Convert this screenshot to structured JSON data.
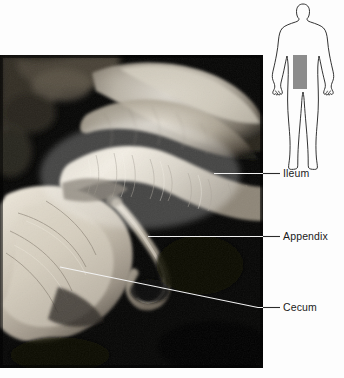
{
  "figure": {
    "kind": "anatomical-dissection-photograph",
    "region": "ileocecal junction",
    "background_color": "#fdfdfd"
  },
  "photo": {
    "name": "cadaver dissection of the ileocecal region",
    "background_color": "#050505",
    "x": 0,
    "y": 55,
    "width": 263,
    "height": 313
  },
  "orientation_diagram": {
    "name": "human body silhouette",
    "outline_color": "#1c1c1c",
    "highlight_color": "#8c8c8c",
    "highlight_region": "lower right abdomen"
  },
  "labels": [
    {
      "id": "ileum",
      "text": "Ileum",
      "leader_type": "horizontal",
      "leader_from_x": 214,
      "leader_from_y": 173,
      "leader_to_x": 280,
      "leader_to_y": 173
    },
    {
      "id": "appendix",
      "text": "Appendix",
      "leader_type": "horizontal",
      "leader_from_x": 148,
      "leader_from_y": 236,
      "leader_to_x": 280,
      "leader_to_y": 236
    },
    {
      "id": "cecum",
      "text": "Cecum",
      "leader_type": "diagonal",
      "leader_from_x": 60,
      "leader_from_y": 267,
      "leader_bend_x": 258,
      "leader_bend_y": 307,
      "leader_to_x": 280,
      "leader_to_y": 307
    }
  ],
  "colors": {
    "leader_on_dark": "#f2f2f2",
    "leader_on_light": "#2b2b2b",
    "label_text": "#1a1a1a"
  }
}
